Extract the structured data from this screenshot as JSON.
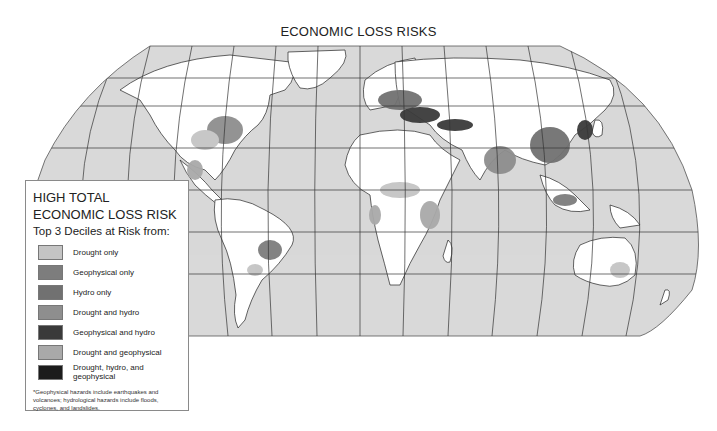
{
  "title": "ECONOMIC LOSS RISKS",
  "colors": {
    "ocean": "#d9d9d9",
    "land": "#ffffff",
    "graticule": "#333333",
    "coast": "#222222"
  },
  "legend": {
    "title": "HIGH TOTAL ECONOMIC LOSS RISK",
    "subtitle": "Top 3 Deciles at Risk from:",
    "items": [
      {
        "label": "Drought only",
        "color": "#c4c4c4"
      },
      {
        "label": "Geophysical only",
        "color": "#7d7d7d"
      },
      {
        "label": "Hydro only",
        "color": "#717171"
      },
      {
        "label": "Drought and hydro",
        "color": "#8e8e8e"
      },
      {
        "label": "Geophysical and hydro",
        "color": "#3a3a3a"
      },
      {
        "label": "Drought and geophysical",
        "color": "#a9a9a9"
      },
      {
        "label": "Drought, hydro, and geophysical",
        "color": "#1c1c1c"
      }
    ],
    "note": "*Geophysical hazards include earthquakes and volcanoes; hydrological hazards include floods, cyclones, and landslides."
  }
}
